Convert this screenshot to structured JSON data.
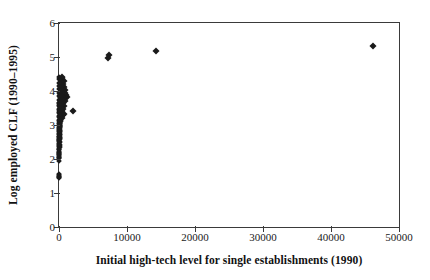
{
  "chart_data": {
    "type": "scatter",
    "title": "",
    "xlabel": "Initial high-tech level for single establishments (1990)",
    "ylabel": "Log employed CLF (1990–1995)",
    "xlim": [
      0,
      50000
    ],
    "ylim": [
      0,
      6
    ],
    "xticks": [
      0,
      10000,
      20000,
      30000,
      40000,
      50000
    ],
    "xticklabels": [
      "0",
      "10000",
      "20000",
      "30000",
      "40000",
      "50000"
    ],
    "yticks": [
      0,
      1,
      2,
      3,
      4,
      5,
      6
    ],
    "yticklabels": [
      "0",
      "1",
      "2",
      "3",
      "4",
      "5",
      "6"
    ],
    "grid": false,
    "legend": null,
    "marker": "diamond",
    "marker_color": "#1a1a1a",
    "points": [
      [
        46200,
        5.33
      ],
      [
        14200,
        5.18
      ],
      [
        7400,
        5.06
      ],
      [
        7250,
        4.97
      ],
      [
        2050,
        3.41
      ],
      [
        1150,
        3.82
      ],
      [
        980,
        3.88
      ],
      [
        900,
        4.02
      ],
      [
        860,
        3.72
      ],
      [
        820,
        3.95
      ],
      [
        780,
        4.12
      ],
      [
        760,
        3.55
      ],
      [
        720,
        3.33
      ],
      [
        700,
        4.3
      ],
      [
        680,
        3.9
      ],
      [
        660,
        3.64
      ],
      [
        640,
        4.07
      ],
      [
        620,
        3.46
      ],
      [
        600,
        3.8
      ],
      [
        580,
        4.22
      ],
      [
        560,
        3.28
      ],
      [
        540,
        3.99
      ],
      [
        520,
        3.7
      ],
      [
        500,
        4.38
      ],
      [
        480,
        3.58
      ],
      [
        460,
        3.86
      ],
      [
        440,
        4.15
      ],
      [
        420,
        3.4
      ],
      [
        400,
        3.76
      ],
      [
        390,
        4.42
      ],
      [
        380,
        3.2
      ],
      [
        370,
        3.93
      ],
      [
        360,
        3.62
      ],
      [
        350,
        4.05
      ],
      [
        340,
        3.5
      ],
      [
        330,
        3.84
      ],
      [
        320,
        4.26
      ],
      [
        310,
        3.36
      ],
      [
        300,
        3.68
      ],
      [
        290,
        3.12
      ],
      [
        280,
        4.0
      ],
      [
        270,
        3.44
      ],
      [
        260,
        3.78
      ],
      [
        250,
        3.25
      ],
      [
        240,
        3.6
      ],
      [
        230,
        4.18
      ],
      [
        220,
        3.05
      ],
      [
        210,
        3.52
      ],
      [
        200,
        3.88
      ],
      [
        195,
        3.18
      ],
      [
        190,
        2.98
      ],
      [
        185,
        3.72
      ],
      [
        180,
        3.3
      ],
      [
        175,
        2.9
      ],
      [
        170,
        3.56
      ],
      [
        165,
        3.1
      ],
      [
        160,
        2.82
      ],
      [
        155,
        3.42
      ],
      [
        150,
        3.02
      ],
      [
        145,
        2.74
      ],
      [
        140,
        3.34
      ],
      [
        135,
        2.94
      ],
      [
        130,
        2.66
      ],
      [
        125,
        3.22
      ],
      [
        120,
        2.86
      ],
      [
        115,
        2.58
      ],
      [
        110,
        3.14
      ],
      [
        105,
        2.78
      ],
      [
        100,
        2.5
      ],
      [
        96,
        3.06
      ],
      [
        92,
        2.7
      ],
      [
        88,
        2.42
      ],
      [
        84,
        2.98
      ],
      [
        80,
        2.62
      ],
      [
        76,
        2.34
      ],
      [
        72,
        2.9
      ],
      [
        68,
        2.54
      ],
      [
        64,
        2.26
      ],
      [
        60,
        2.82
      ],
      [
        56,
        2.46
      ],
      [
        52,
        2.18
      ],
      [
        48,
        2.74
      ],
      [
        44,
        2.38
      ],
      [
        40,
        2.1
      ],
      [
        38,
        2.66
      ],
      [
        36,
        2.3
      ],
      [
        34,
        2.02
      ],
      [
        32,
        2.58
      ],
      [
        30,
        2.22
      ],
      [
        28,
        1.95
      ],
      [
        26,
        2.14
      ],
      [
        24,
        2.06
      ],
      [
        22,
        1.55
      ],
      [
        20,
        1.47
      ],
      [
        18,
        1.52
      ],
      [
        16,
        1.44
      ],
      [
        14,
        2.45
      ],
      [
        12,
        2.35
      ],
      [
        10,
        2.2
      ],
      [
        9,
        2.28
      ],
      [
        8,
        2.12
      ],
      [
        7,
        2.55
      ],
      [
        6,
        2.65
      ],
      [
        5,
        2.75
      ],
      [
        4,
        2.85
      ],
      [
        3,
        2.95
      ],
      [
        2,
        3.05
      ],
      [
        1,
        3.15
      ],
      [
        1,
        3.25
      ],
      [
        2,
        3.35
      ],
      [
        3,
        3.45
      ],
      [
        4,
        3.55
      ],
      [
        5,
        3.65
      ],
      [
        6,
        3.75
      ],
      [
        7,
        3.85
      ],
      [
        8,
        3.95
      ],
      [
        9,
        4.05
      ],
      [
        10,
        4.15
      ],
      [
        12,
        4.25
      ],
      [
        14,
        4.35
      ],
      [
        16,
        4.4
      ],
      [
        20,
        3.02
      ],
      [
        25,
        3.12
      ],
      [
        30,
        3.26
      ],
      [
        35,
        3.38
      ],
      [
        45,
        3.48
      ],
      [
        55,
        3.58
      ],
      [
        65,
        3.66
      ],
      [
        75,
        3.74
      ],
      [
        85,
        3.82
      ],
      [
        95,
        3.92
      ],
      [
        110,
        4.08
      ],
      [
        130,
        4.2
      ],
      [
        150,
        4.32
      ],
      [
        50,
        1.5
      ],
      [
        60,
        1.46
      ],
      [
        18,
        2.04
      ],
      [
        22,
        2.16
      ],
      [
        26,
        2.4
      ],
      [
        34,
        2.52
      ],
      [
        42,
        2.6
      ],
      [
        50,
        2.68
      ],
      [
        58,
        2.78
      ],
      [
        66,
        2.88
      ],
      [
        74,
        3.0
      ],
      [
        82,
        3.16
      ],
      [
        90,
        3.28
      ],
      [
        98,
        3.42
      ],
      [
        106,
        3.54
      ],
      [
        118,
        3.62
      ],
      [
        128,
        3.7
      ],
      [
        138,
        3.78
      ],
      [
        148,
        3.86
      ],
      [
        158,
        3.96
      ],
      [
        168,
        4.06
      ],
      [
        178,
        4.14
      ],
      [
        188,
        4.24
      ],
      [
        198,
        4.34
      ]
    ]
  }
}
